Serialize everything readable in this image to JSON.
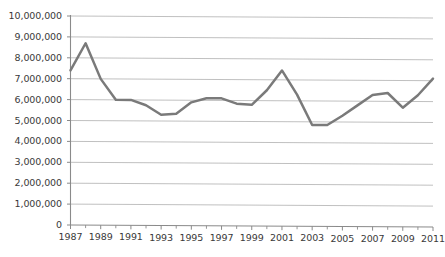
{
  "chart_data": {
    "type": "line",
    "title": "",
    "subtitle": "",
    "xlabel": "",
    "ylabel": "",
    "x": [
      1987,
      1988,
      1989,
      1990,
      1991,
      1992,
      1993,
      1994,
      1995,
      1996,
      1997,
      1998,
      1999,
      2000,
      2001,
      2002,
      2003,
      2004,
      2005,
      2006,
      2007,
      2008,
      2009,
      2010,
      2011
    ],
    "values": [
      7400000,
      8700000,
      7000000,
      6000000,
      6000000,
      5750000,
      5300000,
      5350000,
      5900000,
      6100000,
      6100000,
      5850000,
      5800000,
      6500000,
      7450000,
      6300000,
      4850000,
      4850000,
      5300000,
      5800000,
      6300000,
      6400000,
      5700000,
      6300000,
      7100000
    ],
    "series": [
      {
        "name": "",
        "values": [
          7400000,
          8700000,
          7000000,
          6000000,
          6000000,
          5750000,
          5300000,
          5350000,
          5900000,
          6100000,
          6100000,
          5850000,
          5800000,
          6500000,
          7450000,
          6300000,
          4850000,
          4850000,
          5300000,
          5800000,
          6300000,
          6400000,
          5700000,
          6300000,
          7100000
        ],
        "color": "#7a7a7a"
      }
    ],
    "xlim": [
      1987,
      2011
    ],
    "ylim": [
      0,
      10000000
    ],
    "ytick_values": [
      0,
      1000000,
      2000000,
      3000000,
      4000000,
      5000000,
      6000000,
      7000000,
      8000000,
      9000000,
      10000000
    ],
    "ytick_labels": [
      "0",
      "1,000,000",
      "2,000,000",
      "3,000,000",
      "4,000,000",
      "5,000,000",
      "6,000,000",
      "7,000,000",
      "8,000,000",
      "9,000,000",
      "10,000,000"
    ],
    "xtick_values": [
      1987,
      1989,
      1991,
      1993,
      1995,
      1997,
      1999,
      2001,
      2003,
      2005,
      2007,
      2009,
      2011
    ],
    "xtick_labels": [
      "1987",
      "1989",
      "1991",
      "1993",
      "1995",
      "1997",
      "1999",
      "2001",
      "2003",
      "2005",
      "2007",
      "2009",
      "2011"
    ],
    "xtick_minor_values": [
      1988,
      1990,
      1992,
      1994,
      1996,
      1998,
      2000,
      2002,
      2004,
      2006,
      2008,
      2010
    ],
    "grid": {
      "horizontal": true,
      "vertical": false,
      "color": "#b9b9b9"
    },
    "legend": {
      "visible": false,
      "position": "none",
      "entries": []
    },
    "annotations": [],
    "colors": {
      "line": "#7a7a7a",
      "axis": "#8a8a8a",
      "grid": "#b9b9b9",
      "text": "#3a3a3a",
      "background": "#ffffff"
    },
    "style": {
      "line_width": 2.5,
      "markers": false,
      "appearance": "scanned-document"
    }
  }
}
